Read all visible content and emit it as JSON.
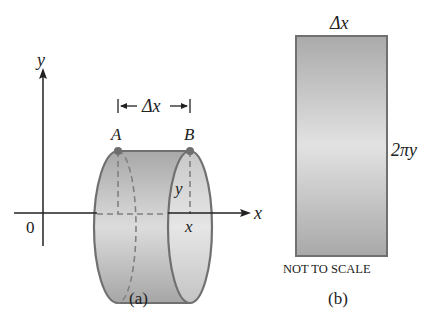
{
  "panel_a": {
    "caption": "(a)",
    "axis_x_label": "x",
    "axis_y_label": "y",
    "origin_label": "0",
    "delta_label": "Δx",
    "point_a": "A",
    "point_b": "B",
    "radius_label": "y",
    "position_label": "x"
  },
  "panel_b": {
    "caption": "(b)",
    "width_label": "Δx",
    "height_label": "2πy",
    "note": "NOT TO SCALE"
  },
  "colors": {
    "surface_dark": "#a8a8a8",
    "surface_light": "#dedede",
    "outline": "#707070",
    "axis": "#222222"
  }
}
